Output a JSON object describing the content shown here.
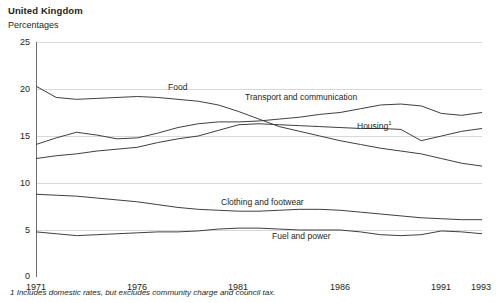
{
  "header": {
    "title": "United Kingdom",
    "subtitle": "Percentages"
  },
  "footnote": "1 Includes domestic rates, but excludes community charge and council tax.",
  "axis": {
    "y_ticks": [
      "0",
      "5",
      "10",
      "15",
      "20",
      "25"
    ],
    "x_ticks": [
      "1971",
      "1976",
      "1981",
      "1986",
      "1991",
      "1993"
    ]
  },
  "labels": {
    "food": "Food",
    "transport": "Transport and communication",
    "housing": "Housing",
    "housing_sup": "1",
    "clothing": "Clothing and footwear",
    "fuel": "Fuel and power"
  },
  "colors": {
    "line": "#3f3f3f",
    "grid": "#d8d8d8",
    "axis": "#6f6f6f",
    "text": "#231f20"
  },
  "chart_data": {
    "type": "line",
    "title": "United Kingdom",
    "subtitle": "Percentages",
    "xlabel": "",
    "ylabel": "Percentages",
    "ylim": [
      0,
      25
    ],
    "xlim": [
      1971,
      1993
    ],
    "grid": true,
    "legend": "inline-labels",
    "x": [
      1971,
      1972,
      1973,
      1974,
      1975,
      1976,
      1977,
      1978,
      1979,
      1980,
      1981,
      1982,
      1983,
      1984,
      1985,
      1986,
      1987,
      1988,
      1989,
      1990,
      1991,
      1992,
      1993
    ],
    "series": [
      {
        "name": "Food",
        "values": [
          20.3,
          19.1,
          18.9,
          19.0,
          19.1,
          19.2,
          19.1,
          18.9,
          18.7,
          18.3,
          17.6,
          16.8,
          16.0,
          15.5,
          15.0,
          14.5,
          14.1,
          13.7,
          13.4,
          13.1,
          12.6,
          12.1,
          11.8
        ]
      },
      {
        "name": "Transport and communication",
        "values": [
          14.1,
          14.8,
          15.4,
          15.1,
          14.7,
          14.8,
          15.3,
          15.9,
          16.3,
          16.5,
          16.5,
          16.6,
          16.8,
          17.0,
          17.3,
          17.5,
          17.9,
          18.3,
          18.4,
          18.2,
          17.4,
          17.2,
          17.5
        ]
      },
      {
        "name": "Housing",
        "values": [
          12.6,
          12.9,
          13.1,
          13.4,
          13.6,
          13.8,
          14.3,
          14.7,
          15.0,
          15.6,
          16.2,
          16.3,
          16.2,
          16.1,
          16.0,
          15.9,
          15.8,
          15.8,
          15.7,
          14.5,
          15.0,
          15.5,
          15.8
        ]
      },
      {
        "name": "Clothing and footwear",
        "values": [
          8.8,
          8.7,
          8.6,
          8.4,
          8.2,
          8.0,
          7.7,
          7.4,
          7.2,
          7.1,
          7.0,
          7.0,
          7.1,
          7.2,
          7.2,
          7.1,
          6.9,
          6.7,
          6.5,
          6.3,
          6.2,
          6.1,
          6.1
        ]
      },
      {
        "name": "Fuel and power",
        "values": [
          4.8,
          4.6,
          4.4,
          4.5,
          4.6,
          4.7,
          4.8,
          4.8,
          4.9,
          5.1,
          5.2,
          5.2,
          5.1,
          5.0,
          5.0,
          5.0,
          4.8,
          4.5,
          4.4,
          4.5,
          4.9,
          4.8,
          4.6
        ]
      }
    ]
  }
}
